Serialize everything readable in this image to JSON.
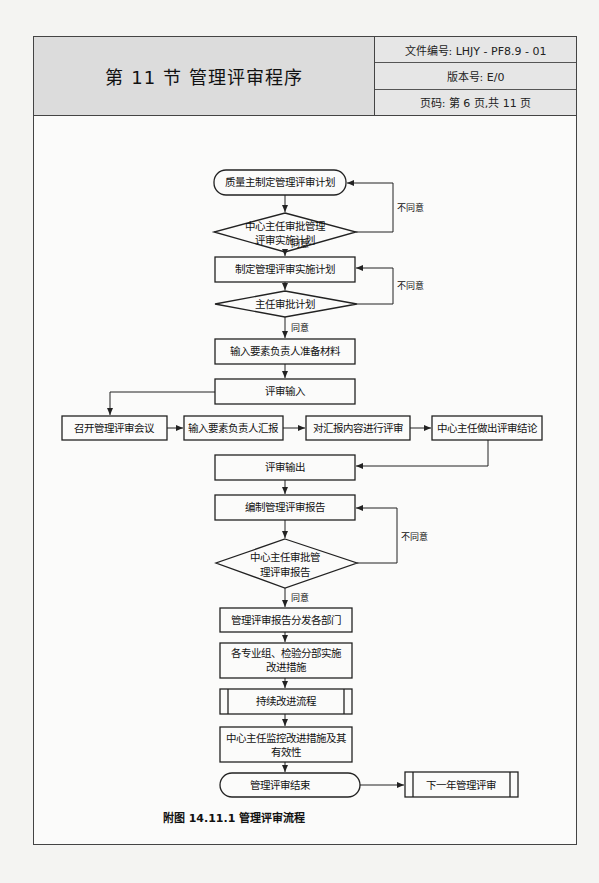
{
  "header": {
    "title": "第 11 节   管理评审程序",
    "doc_number": "文件编号: LHJY - PF8.9 - 01",
    "version": "版本号: E/0",
    "page": "页码: 第 6 页,共 11 页"
  },
  "flowchart": {
    "nodes": {
      "n1": "质量主制定管理评审计划",
      "n2a": "中心主任审批管理",
      "n2b": "评审实施计划",
      "n3": "制定管理评审实施计划",
      "n4": "主任审批计划",
      "n5": "输入要素负责人准备材料",
      "n6": "评审输入",
      "n7": "召开管理评审会议",
      "n8": "输入要素负责人汇报",
      "n9": "对汇报内容进行评审",
      "n10": "中心主任做出评审结论",
      "n11": "评审输出",
      "n12": "编制管理评审报告",
      "n13a": "中心主任审批管",
      "n13b": "理评审报告",
      "n14": "管理评审报告分发各部门",
      "n15a": "各专业组、检验分部实施",
      "n15b": "改进措施",
      "n16": "持续改进流程",
      "n17a": "中心主任监控改进措施及其",
      "n17b": "有效性",
      "n18": "管理评审结束",
      "n19": "下一年管理评审"
    },
    "labels": {
      "agree": "同意",
      "disagree": "不同意"
    },
    "caption": "附图 14.11.1   管理评审流程"
  }
}
